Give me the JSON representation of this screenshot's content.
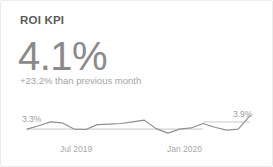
{
  "card": {
    "title": "ROI KPI",
    "value": "4.1%",
    "delta": "+23.2% than previous month",
    "accent_color": "#8a8a8a",
    "line_color": "#8f8f8f",
    "baseline_color": "#c9c9c9",
    "background": "#ffffff",
    "border_color": "#ececec"
  },
  "chart_data": {
    "type": "line",
    "title": "ROI KPI",
    "xlabel": "",
    "ylabel": "",
    "grid": false,
    "legend": "none",
    "start_label": "3.3%",
    "end_label": "3.9%",
    "tick_labels": [
      "Jul 2019",
      "Jan 2020"
    ],
    "tick_positions": [
      7,
      13
    ],
    "ylim": [
      2.9,
      4.2
    ],
    "x": [
      "Feb 2019",
      "Mar 2019",
      "Apr 2019",
      "May 2019",
      "Jun 2019",
      "Jul 2019",
      "Aug 2019",
      "Sep 2019",
      "Oct 2019",
      "Nov 2019",
      "Dec 2019",
      "Jan 2020",
      "Feb 2020",
      "Mar 2020",
      "Apr 2020",
      "May 2020",
      "Jun 2020",
      "Jul 2020",
      "Aug 2020",
      "Sep 2020"
    ],
    "values": [
      3.3,
      3.45,
      3.62,
      3.58,
      3.3,
      3.28,
      3.5,
      3.52,
      3.55,
      3.62,
      3.7,
      3.32,
      3.12,
      3.3,
      3.35,
      3.55,
      3.38,
      3.25,
      3.3,
      3.9
    ],
    "series": [
      {
        "name": "ROI",
        "values": [
          3.3,
          3.45,
          3.62,
          3.58,
          3.3,
          3.28,
          3.5,
          3.52,
          3.55,
          3.62,
          3.7,
          3.32,
          3.12,
          3.3,
          3.35,
          3.55,
          3.38,
          3.25,
          3.3,
          3.9
        ]
      }
    ],
    "reference_lines": [
      {
        "name": "start-baseline",
        "value": 3.3,
        "x_from": 0,
        "x_to": 15
      },
      {
        "name": "end-baseline",
        "value": 3.62,
        "x_from": 15,
        "x_to": 19
      }
    ]
  }
}
